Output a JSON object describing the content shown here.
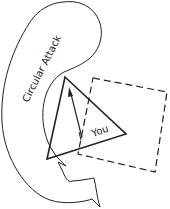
{
  "diagram": {
    "labels": {
      "attack": "Circular Attack",
      "player": "You"
    },
    "shapes": {
      "attack_arrow": "curved-arrow",
      "player_marker": "triangle",
      "facing_arrow": "arrow",
      "zone": "dashed-square"
    },
    "colors": {
      "stroke": "#222222",
      "background": "#ffffff"
    }
  }
}
